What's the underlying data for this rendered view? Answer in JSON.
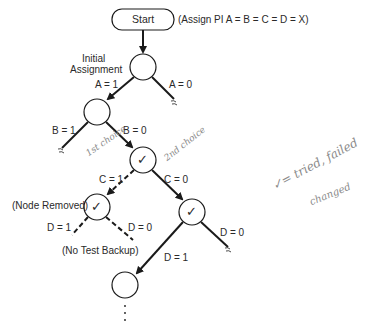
{
  "diagram": {
    "start_label": "Start",
    "start_note": "(Assign PI A = B = C = D = X)",
    "initial_label_line1": "Initial",
    "initial_label_line2": "Assignment",
    "edges": {
      "a1": "A = 1",
      "a0": "A = 0",
      "b1": "B = 1",
      "b0": "B = 0",
      "c1": "C = 1",
      "c0": "C = 0",
      "d1_left": "D = 1",
      "d0_left": "D = 0",
      "d1_right": "D = 1",
      "d0_right": "D = 0"
    },
    "node_removed_label": "(Node Removed)",
    "no_test_backup_label": "(No Test Backup)",
    "check_mark": "✓",
    "continuation": "⋮",
    "handwritten": {
      "first_choice": "1st choice",
      "second_choice": "2nd choice",
      "legend_line1": "✓= tried, failed",
      "legend_line2": "changed"
    },
    "colors": {
      "line": "#1a1a1a",
      "handwriting": "#8a8a8a"
    }
  }
}
